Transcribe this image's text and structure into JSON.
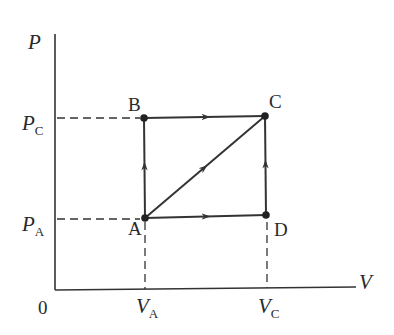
{
  "diagram": {
    "type": "PV thermodynamic process diagram",
    "axes": {
      "y_label": "P",
      "x_label": "V",
      "origin_label": "0",
      "y_ticks": [
        {
          "symbol": "P",
          "subscript": "C"
        },
        {
          "symbol": "P",
          "subscript": "A"
        }
      ],
      "x_ticks": [
        {
          "symbol": "V",
          "subscript": "A"
        },
        {
          "symbol": "V",
          "subscript": "C"
        }
      ]
    },
    "points": [
      {
        "label": "A",
        "V": "V_A",
        "P": "P_A"
      },
      {
        "label": "B",
        "V": "V_A",
        "P": "P_C"
      },
      {
        "label": "C",
        "V": "V_C",
        "P": "P_C"
      },
      {
        "label": "D",
        "V": "V_C",
        "P": "P_A"
      }
    ],
    "paths": [
      {
        "from": "A",
        "to": "B",
        "direction": "up"
      },
      {
        "from": "B",
        "to": "C",
        "direction": "right"
      },
      {
        "from": "A",
        "to": "C",
        "direction": "diagonal"
      },
      {
        "from": "A",
        "to": "D",
        "direction": "right"
      },
      {
        "from": "D",
        "to": "C",
        "direction": "up"
      }
    ],
    "line_color": "#333333"
  }
}
